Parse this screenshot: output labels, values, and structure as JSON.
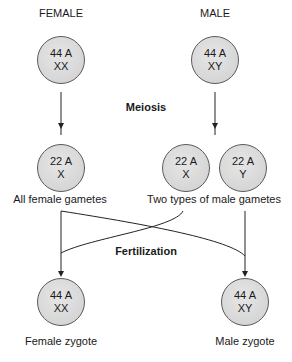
{
  "headers": {
    "female": "FEMALE",
    "male": "MALE"
  },
  "parents": {
    "female": {
      "line1": "44 A",
      "line2": "XX"
    },
    "male": {
      "line1": "44 A",
      "line2": "XY"
    }
  },
  "process1": "Meiosis",
  "gametes": {
    "female": {
      "line1": "22 A",
      "line2": "X"
    },
    "male_x": {
      "line1": "22 A",
      "line2": "X"
    },
    "male_y": {
      "line1": "22 A",
      "line2": "Y"
    },
    "female_label": "All female gametes",
    "male_label": "Two types of male gametes"
  },
  "process2": "Fertilization",
  "zygotes": {
    "female": {
      "line1": "44 A",
      "line2": "XX",
      "label": "Female zygote"
    },
    "male": {
      "line1": "44 A",
      "line2": "XY",
      "label": "Male zygote"
    }
  },
  "caption": "",
  "colors": {
    "cell_fill": "#d8d8d8",
    "cell_border": "#5a5a5a",
    "line": "#222222"
  }
}
